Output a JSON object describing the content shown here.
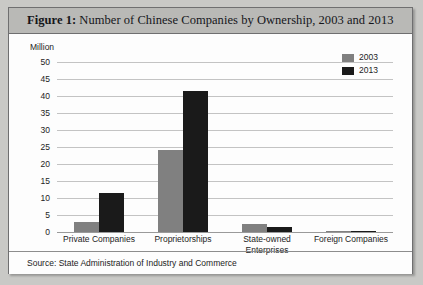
{
  "figure": {
    "label": "Figure 1:",
    "title": " Number of Chinese Companies by Ownership, 2003 and 2013",
    "source": "Source: State Administration of Industry and Commerce",
    "unit_label": "Million"
  },
  "colors": {
    "series_2003": "#808080",
    "series_2013": "#1a1a1a",
    "frame_background": "#ffffff",
    "title_background": "#b9b9b6",
    "border": "#6f6f70",
    "gridline": "#c3c3c3",
    "page_background": "#c9c9c6"
  },
  "legend": {
    "position": "top-right",
    "entries": [
      {
        "label": "2003",
        "color": "#808080"
      },
      {
        "label": "2013",
        "color": "#1a1a1a"
      }
    ]
  },
  "chart_data": {
    "type": "bar",
    "title": "Number of Chinese Companies by Ownership, 2003 and 2013",
    "xlabel": "",
    "ylabel": "Million",
    "ylim": [
      0,
      50
    ],
    "yticks": [
      0,
      5,
      10,
      15,
      20,
      25,
      30,
      35,
      40,
      45,
      50
    ],
    "ytick_labels": [
      "0",
      "5",
      "10",
      "15",
      "20",
      "25",
      "30",
      "35",
      "40",
      "45",
      "50"
    ],
    "grid": true,
    "categories": [
      "Private Companies",
      "Proprietorships",
      "State-owned Enterprises",
      "Foreign Companies"
    ],
    "category_lines": [
      [
        "Private Companies"
      ],
      [
        "Proprietorships"
      ],
      [
        "State-owned",
        "Enterprises"
      ],
      [
        "Foreign Companies"
      ]
    ],
    "series": [
      {
        "name": "2003",
        "color": "#808080",
        "values": [
          3.0,
          24.0,
          2.3,
          0.4
        ]
      },
      {
        "name": "2013",
        "color": "#1a1a1a",
        "values": [
          11.5,
          41.5,
          1.5,
          0.4
        ]
      }
    ]
  }
}
